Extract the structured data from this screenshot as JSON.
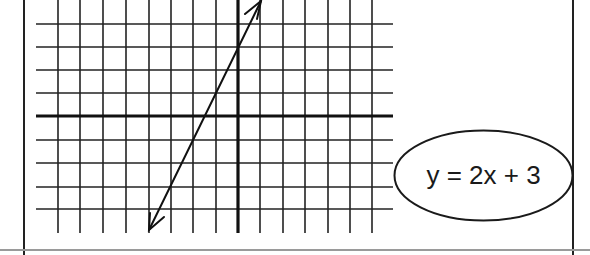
{
  "diagram": {
    "type": "coordinate-grid-with-line",
    "equation": "y = 2x + 3",
    "grid": {
      "x_min": -9,
      "x_max": 7,
      "y_min": -5,
      "y_max": 4,
      "cell_size_px": 22.6,
      "origin_px": [
        238,
        116
      ]
    },
    "line": {
      "slope": 2,
      "y_intercept": 3,
      "arrows": [
        "both-ends"
      ]
    },
    "colors": {
      "ink": "#1a1a1a",
      "border": "#222222",
      "bottom_rule": "#9a9a9a",
      "background": "#ffffff"
    }
  }
}
